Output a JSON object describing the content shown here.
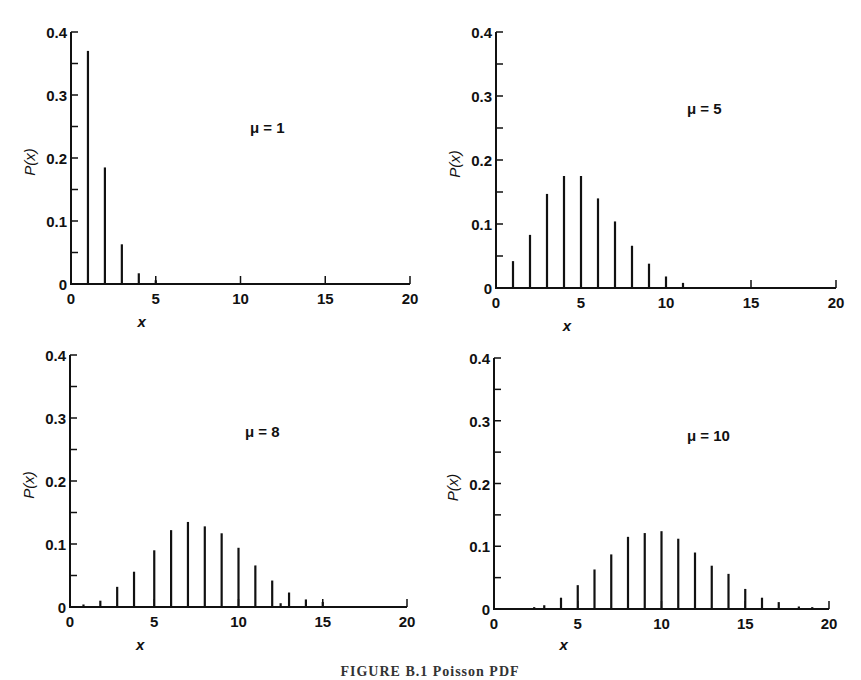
{
  "figure": {
    "caption": "FIGURE B.1 Poisson PDF",
    "ink_color": "#111111",
    "background": "#ffffff"
  },
  "chart_data": [
    {
      "type": "bar",
      "subtype": "stem",
      "annotation": "μ = 1",
      "xlabel": "x",
      "ylabel": "P(x)",
      "xlim": [
        0,
        20
      ],
      "ylim": [
        0,
        0.4
      ],
      "xticks": [
        "0",
        "5",
        "10",
        "15",
        "20"
      ],
      "yticks": [
        "0",
        "0.1",
        "0.2",
        "0.3",
        "0.4"
      ],
      "grid": false,
      "legend": false,
      "x": [
        1,
        2,
        3,
        4,
        5
      ],
      "values": [
        0.37,
        0.185,
        0.063,
        0.017,
        0.006
      ]
    },
    {
      "type": "bar",
      "subtype": "stem",
      "annotation": "μ = 5",
      "xlabel": "x",
      "ylabel": "P(x)",
      "xlim": [
        0,
        20
      ],
      "ylim": [
        0,
        0.4
      ],
      "xticks": [
        "0",
        "5",
        "10",
        "15",
        "20"
      ],
      "yticks": [
        "0",
        "0.1",
        "0.2",
        "0.3",
        "0.4"
      ],
      "grid": false,
      "legend": false,
      "x": [
        1,
        2,
        3,
        4,
        5,
        6,
        7,
        8,
        9,
        10,
        11
      ],
      "values": [
        0.042,
        0.083,
        0.147,
        0.175,
        0.175,
        0.14,
        0.104,
        0.066,
        0.038,
        0.018,
        0.008
      ]
    },
    {
      "type": "bar",
      "subtype": "stem",
      "annotation": "μ = 8",
      "xlabel": "x",
      "ylabel": "P(x)",
      "xlim": [
        0,
        20
      ],
      "ylim": [
        0,
        0.4
      ],
      "xticks": [
        "0",
        "5",
        "10",
        "15",
        "20"
      ],
      "yticks": [
        "0",
        "0.1",
        "0.2",
        "0.3",
        "0.4"
      ],
      "grid": false,
      "legend": false,
      "x": [
        0.8,
        1.8,
        2.8,
        3.8,
        5,
        6,
        7,
        8,
        9,
        10,
        11,
        12,
        12.5,
        13,
        14,
        15
      ],
      "values": [
        0.004,
        0.01,
        0.032,
        0.056,
        0.09,
        0.122,
        0.135,
        0.128,
        0.117,
        0.094,
        0.066,
        0.042,
        0.006,
        0.023,
        0.012,
        0.008
      ]
    },
    {
      "type": "bar",
      "subtype": "stem",
      "annotation": "μ = 10",
      "xlabel": "x",
      "ylabel": "P(x)",
      "xlim": [
        0,
        20
      ],
      "ylim": [
        0,
        0.4
      ],
      "xticks": [
        "0",
        "5",
        "10",
        "15",
        "20"
      ],
      "yticks": [
        "0",
        "0.1",
        "0.2",
        "0.3",
        "0.4"
      ],
      "grid": false,
      "legend": false,
      "x": [
        2.4,
        3,
        4,
        5,
        6,
        7,
        8,
        9,
        10,
        11,
        12,
        13,
        14,
        15,
        16,
        17,
        18.2,
        19
      ],
      "values": [
        0.003,
        0.006,
        0.018,
        0.038,
        0.063,
        0.087,
        0.115,
        0.121,
        0.124,
        0.112,
        0.09,
        0.069,
        0.056,
        0.032,
        0.018,
        0.011,
        0.004,
        0.003
      ]
    }
  ]
}
